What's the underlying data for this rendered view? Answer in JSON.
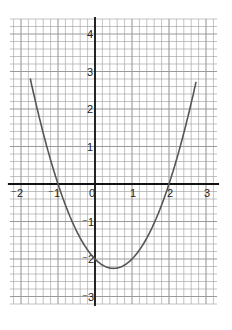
{
  "chart_data": {
    "type": "line",
    "title": "",
    "xlabel": "",
    "ylabel": "",
    "xlim": [
      -2.3,
      3.3
    ],
    "ylim": [
      -3.2,
      4.4
    ],
    "grid": true,
    "minor_grid_step": 0.2,
    "x_ticks": [
      -2,
      -1,
      0,
      1,
      2,
      3
    ],
    "y_ticks": [
      -3,
      -2,
      -1,
      1,
      2,
      3,
      4
    ],
    "x_tick_labels": [
      "⁻2",
      "⁻1",
      "0",
      "1",
      "2",
      "3"
    ],
    "y_tick_labels": [
      "⁻3",
      "⁻2",
      "⁻1",
      "1",
      "2",
      "3",
      "4"
    ],
    "series": [
      {
        "name": "y = x² − x − 2",
        "color": "#555555",
        "x": [
          -1.6,
          -1.5,
          -1,
          -0.5,
          0,
          0.5,
          1,
          1.5,
          2,
          2.5,
          2.6
        ],
        "y": [
          3.16,
          1.75,
          0,
          -1.25,
          -2,
          -2.25,
          -2,
          -1.25,
          0,
          1.75,
          2.16
        ]
      }
    ],
    "roots": [
      -1,
      2
    ],
    "vertex": [
      0.5,
      -2.25
    ],
    "y_intercept": -2
  },
  "colors": {
    "grid": "#9a9a9a",
    "axis": "#111111",
    "curve": "#555555"
  }
}
